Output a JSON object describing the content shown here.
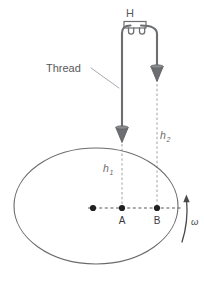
{
  "figure": {
    "type": "physics-diagram",
    "background_color": "#ffffff"
  },
  "labels": {
    "support": "H",
    "thread": "Thread",
    "height_1": "h",
    "height_1_sub": "1",
    "height_2": "h",
    "height_2_sub": "2",
    "point_a": "A",
    "point_b": "B",
    "angular_velocity": "ω"
  },
  "colors": {
    "thread": "#6d6e71",
    "bob": "#6d6e71",
    "bob_dark": "#58595b",
    "disc_outline": "#58595b",
    "dashed": "#a7a9ac",
    "point_dot": "#231f20",
    "text": "#58595b",
    "text_italic": "#6b6c6e",
    "leader": "#a7a9ac"
  },
  "geometry": {
    "canvas_width": 204,
    "canvas_height": 282,
    "support_bar": {
      "x": 124,
      "y": 21,
      "width": 22,
      "height": 7
    },
    "thread_left_x": 122,
    "thread_right_x": 157,
    "bob_left": {
      "x": 122,
      "y": 130
    },
    "bob_right": {
      "x": 157,
      "y": 69
    },
    "disc": {
      "cx": 96,
      "cy": 206,
      "rx": 82,
      "ry": 58
    },
    "center_dot": {
      "x": 93,
      "y": 208
    },
    "point_a_dot": {
      "x": 122,
      "y": 208
    },
    "point_b_dot": {
      "x": 157,
      "y": 208
    },
    "omega_arrow": {
      "x": 186,
      "y_top": 196,
      "y_bottom": 243
    }
  },
  "elements": {
    "dots": [
      {
        "name": "center-dot",
        "label": ""
      },
      {
        "name": "point-a-dot",
        "label": "A"
      },
      {
        "name": "point-b-dot",
        "label": "B"
      }
    ]
  }
}
